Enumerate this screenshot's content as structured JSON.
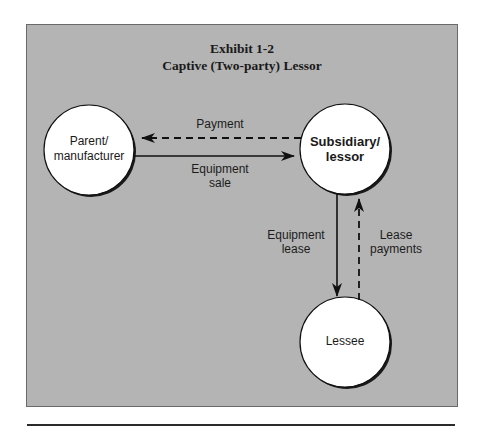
{
  "exhibit": {
    "number": "Exhibit 1-2",
    "title": "Captive (Two-party) Lessor"
  },
  "colors": {
    "background": "#b4b4b4",
    "node_fill": "#ffffff",
    "stroke": "#111111"
  },
  "nodes": [
    {
      "id": "parent",
      "line1": "Parent/",
      "line2": "manufacturer",
      "bold": false
    },
    {
      "id": "subsidiary",
      "line1": "Subsidiary/",
      "line2": "lessor",
      "bold": true
    },
    {
      "id": "lessee",
      "line1": "Lessee",
      "bold": false
    }
  ],
  "edges": [
    {
      "id": "payment",
      "from": "subsidiary",
      "to": "parent",
      "style": "dashed",
      "label": "Payment"
    },
    {
      "id": "equipment-sale",
      "from": "parent",
      "to": "subsidiary",
      "style": "solid",
      "label_line1": "Equipment",
      "label_line2": "sale"
    },
    {
      "id": "equipment-lease",
      "from": "subsidiary",
      "to": "lessee",
      "style": "solid",
      "label_line1": "Equipment",
      "label_line2": "lease"
    },
    {
      "id": "lease-payments",
      "from": "lessee",
      "to": "subsidiary",
      "style": "dashed",
      "label_line1": "Lease",
      "label_line2": "payments"
    }
  ]
}
